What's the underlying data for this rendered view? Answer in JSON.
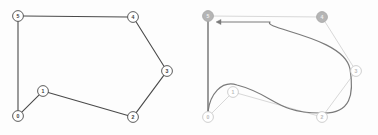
{
  "figure": {
    "type": "graph-visualization",
    "background_color": "#fdfdfd",
    "panel_count": 2,
    "width": 378,
    "height": 135
  },
  "chart_data": {
    "type": "diagram",
    "title": "",
    "subtitle": "",
    "xlabel": "",
    "ylabel": "",
    "node_ids": [
      "0",
      "1",
      "2",
      "3",
      "4",
      "5"
    ],
    "panels": [
      {
        "name": "input-graph",
        "caption": "",
        "style": "undirected graph with dark edges",
        "nodes": [
          {
            "id": "0",
            "label": "0",
            "x": 18,
            "y": 116,
            "fill": "#ffffff",
            "stroke": "#4a4a4a",
            "text_color": "#3c3c3c"
          },
          {
            "id": "1",
            "label": "1",
            "x": 43,
            "y": 91,
            "fill": "#ffffff",
            "stroke": "#4a4a4a",
            "text_color": "#3c3c3c"
          },
          {
            "id": "2",
            "label": "2",
            "x": 133,
            "y": 117,
            "fill": "#ffffff",
            "stroke": "#4a4a4a",
            "text_color": "#3c3c3c"
          },
          {
            "id": "3",
            "label": "3",
            "x": 167,
            "y": 71,
            "fill": "#ffffff",
            "stroke": "#4a4a4a",
            "text_color": "#3c3c3c"
          },
          {
            "id": "4",
            "label": "4",
            "x": 133,
            "y": 17,
            "fill": "#ffffff",
            "stroke": "#4a4a4a",
            "text_color": "#3c3c3c"
          },
          {
            "id": "5",
            "label": "5",
            "x": 18,
            "y": 16,
            "fill": "#ffffff",
            "stroke": "#4a4a4a",
            "text_color": "#3c3c3c"
          }
        ],
        "edges": [
          {
            "from": "5",
            "to": "4",
            "color": "#4a4a4a",
            "width": 1.1
          },
          {
            "from": "5",
            "to": "0",
            "color": "#4a4a4a",
            "width": 1.1
          },
          {
            "from": "4",
            "to": "3",
            "color": "#4a4a4a",
            "width": 1.1
          },
          {
            "from": "3",
            "to": "2",
            "color": "#4a4a4a",
            "width": 1.1
          },
          {
            "from": "2",
            "to": "1",
            "color": "#4a4a4a",
            "width": 1.1
          },
          {
            "from": "1",
            "to": "0",
            "color": "#4a4a4a",
            "width": 1.1
          }
        ]
      },
      {
        "name": "tour-overlay-graph",
        "caption": "",
        "style": "faded graph with dark curved directed tour and arrowhead into node 5",
        "nodes": [
          {
            "id": "0",
            "label": "0",
            "x": 208,
            "y": 117,
            "fill": "#ffffff",
            "stroke": "#c9c9c9",
            "text_color": "#bdbdbd",
            "highlighted": false
          },
          {
            "id": "1",
            "label": "1",
            "x": 233,
            "y": 92,
            "fill": "#ffffff",
            "stroke": "#c9c9c9",
            "text_color": "#bdbdbd",
            "highlighted": false
          },
          {
            "id": "2",
            "label": "2",
            "x": 322,
            "y": 117,
            "fill": "#ffffff",
            "stroke": "#c9c9c9",
            "text_color": "#bdbdbd",
            "highlighted": false
          },
          {
            "id": "3",
            "label": "3",
            "x": 356,
            "y": 71,
            "fill": "#ffffff",
            "stroke": "#c9c9c9",
            "text_color": "#bdbdbd",
            "highlighted": false
          },
          {
            "id": "4",
            "label": "4",
            "x": 322,
            "y": 17,
            "fill": "#b5b5b5",
            "stroke": "#a8a8a8",
            "text_color": "#f0f0f0",
            "highlighted": true
          },
          {
            "id": "5",
            "label": "5",
            "x": 208,
            "y": 16,
            "fill": "#b5b5b5",
            "stroke": "#a8a8a8",
            "text_color": "#f0f0f0",
            "highlighted": true
          }
        ],
        "edges": [
          {
            "from": "5",
            "to": "4",
            "color": "#d8d8d8",
            "width": 1.0
          },
          {
            "from": "5",
            "to": "0",
            "color": "#4a4a4a",
            "width": 1.1
          },
          {
            "from": "4",
            "to": "3",
            "color": "#d8d8d8",
            "width": 1.0
          },
          {
            "from": "3",
            "to": "2",
            "color": "#d8d8d8",
            "width": 1.0
          },
          {
            "from": "2",
            "to": "1",
            "color": "#d8d8d8",
            "width": 1.0
          },
          {
            "from": "1",
            "to": "0",
            "color": "#d8d8d8",
            "width": 1.0
          }
        ],
        "tour_path": {
          "name": "curved-tour",
          "sequence": [
            "0",
            "1",
            "2",
            "3",
            "4",
            "5"
          ],
          "color": "#7a7a7a",
          "width": 1.2,
          "arrow_at": "5",
          "arrow_direction": "left"
        }
      }
    ],
    "legend": [],
    "annotations": [],
    "grid": false
  },
  "colors": {
    "edge_dark": "#4a4a4a",
    "edge_faded": "#d8d8d8",
    "tour": "#7a7a7a",
    "node_fill": "#ffffff",
    "node_highlight_fill": "#b5b5b5",
    "background": "#fdfdfd"
  }
}
